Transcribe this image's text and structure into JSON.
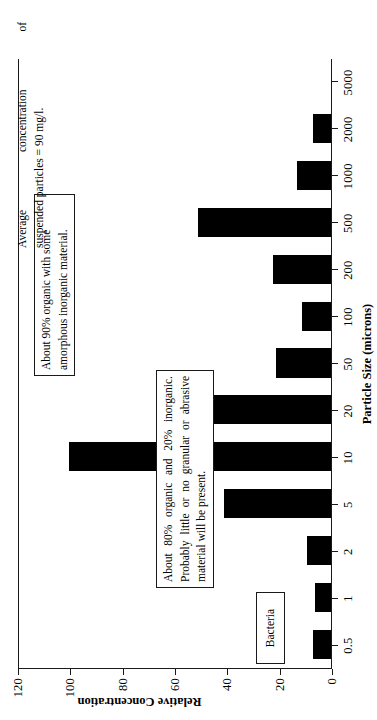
{
  "chart_data": {
    "type": "bar",
    "title": "",
    "xlabel": "Particle Size (microns)",
    "ylabel": "Relative Concentration",
    "categories": [
      "0.5",
      "1",
      "2",
      "5",
      "10",
      "20",
      "50",
      "100",
      "200",
      "500",
      "1000",
      "2000",
      "5000"
    ],
    "values": [
      7,
      6,
      9,
      41,
      100,
      51,
      21,
      11,
      22,
      51,
      13,
      7,
      0
    ],
    "ylim": [
      0,
      120
    ],
    "ytick_labels": [
      "0",
      "20",
      "40",
      "60",
      "80",
      "100",
      "120"
    ],
    "ytick_values": [
      0,
      20,
      40,
      60,
      80,
      100,
      120
    ],
    "grid": false,
    "legend": "none",
    "orientation": "vertical",
    "bar_color": "#000000",
    "annotations": [
      {
        "id": "organic",
        "boxed": true,
        "lines": [
          "About 80% organic and 20% inorganic.",
          "Probably little or no granular or abrasive",
          "material will be present."
        ]
      },
      {
        "id": "inorganic",
        "boxed": true,
        "lines": [
          "About 90% organic with some",
          "amorphous inorganic material."
        ]
      },
      {
        "id": "bacteria",
        "boxed": true,
        "lines": [
          "Bacteria"
        ]
      },
      {
        "id": "average",
        "boxed": false,
        "lines": [
          "Average concentration of",
          "suspended particles = 90 mg/l."
        ]
      }
    ]
  },
  "axes": {
    "value_axis_title": "Relative Concentration",
    "category_axis_title": "Particle Size (microns)"
  },
  "annotation_text": {
    "organic_line1": "About 80% organic and 20% inorganic.",
    "organic_line2": "Probably little or no granular or abrasive",
    "organic_line3": "material will be present.",
    "inorganic_line1": "About 90% organic with some",
    "inorganic_line2": "amorphous inorganic material.",
    "bacteria_label": "Bacteria",
    "average_line1": "Average concentration of",
    "average_line2": "suspended particles = 90 mg/l."
  }
}
